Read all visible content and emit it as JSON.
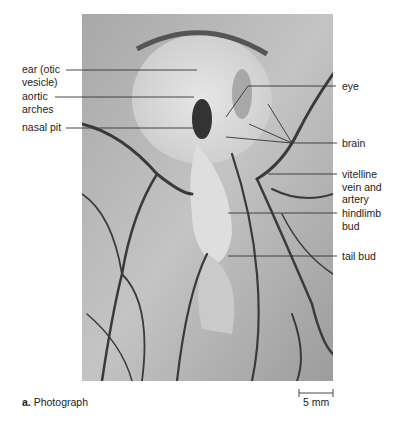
{
  "figure": {
    "panel_letter": "a.",
    "panel_title": "Photograph",
    "scale_bar_label": "5 mm"
  },
  "labels_left": [
    {
      "id": "ear",
      "line1": "ear (otic",
      "line2": "vesicle)"
    },
    {
      "id": "aortic-arches",
      "line1": "aortic",
      "line2": "arches"
    },
    {
      "id": "nasal-pit",
      "line1": "nasal pit",
      "line2": ""
    }
  ],
  "labels_right": [
    {
      "id": "eye",
      "line1": "eye"
    },
    {
      "id": "brain",
      "line1": "brain"
    },
    {
      "id": "vitelline",
      "line1": "vitelline",
      "line2": "vein and",
      "line3": "artery"
    },
    {
      "id": "hindlimb-bud",
      "line1": "hindlimb",
      "line2": "bud"
    },
    {
      "id": "tail-bud",
      "line1": "tail bud"
    }
  ],
  "colors": {
    "photo_base": "#bdbdbd",
    "vessel": "#3a3a3a",
    "leader_line": "#333333"
  }
}
